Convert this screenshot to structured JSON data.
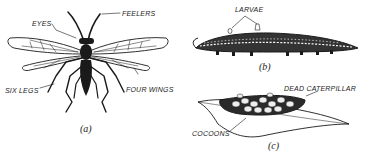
{
  "figure": {
    "panel_a": {
      "caption": "(a)",
      "labels": {
        "eyes": "EYES",
        "feelers": "FEELERS",
        "six_legs": "SIX LEGS",
        "four_wings": "FOUR WINGS"
      }
    },
    "panel_b": {
      "caption": "(b)",
      "labels": {
        "larvae": "LARVAE"
      }
    },
    "panel_c": {
      "caption": "(c)",
      "labels": {
        "dead_caterpillar": "DEAD CATERPILLAR",
        "cocoons": "COCOONS"
      }
    },
    "colors": {
      "ink": "#1a1a1a",
      "paper": "#ffffff"
    }
  }
}
